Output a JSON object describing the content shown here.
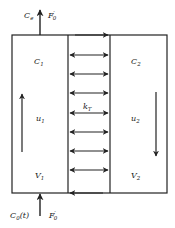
{
  "diagram": {
    "type": "two-compartment flow model",
    "colors": {
      "line": "#222222",
      "background": "#ffffff"
    },
    "outlet": {
      "concentration": "C",
      "concentration_sub": "e",
      "flow": "F",
      "flow_sup": "′",
      "flow_sub": "0"
    },
    "inlet": {
      "concentration": "C",
      "concentration_sub": "0",
      "concentration_arg": "(t)",
      "flow": "F",
      "flow_sup": "′",
      "flow_sub": "0"
    },
    "compartment_1": {
      "concentration": "C",
      "concentration_sub": "1",
      "velocity": "u",
      "velocity_sub": "1",
      "volume": "V",
      "volume_sub": "1",
      "flow_direction": "up"
    },
    "compartment_2": {
      "concentration": "C",
      "concentration_sub": "2",
      "velocity": "u",
      "velocity_sub": "2",
      "volume": "V",
      "volume_sub": "2",
      "flow_direction": "down"
    },
    "exchange": {
      "coefficient": "k",
      "coefficient_sub": "T",
      "arrow_count": 7
    }
  }
}
